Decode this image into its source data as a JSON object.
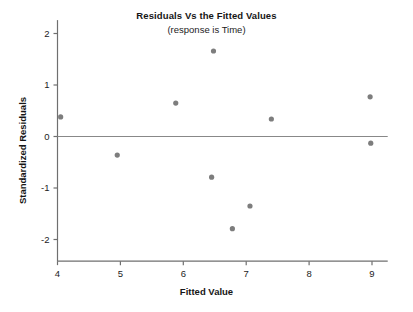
{
  "chart_data": {
    "type": "scatter",
    "title": "Residuals Vs the Fitted Values",
    "subtitle": "(response is Time)",
    "xlabel": "Fitted Value",
    "ylabel": "Standardized Residuals",
    "xlim": [
      3.82,
      9.25
    ],
    "ylim": [
      -2.42,
      2.26
    ],
    "xticks": [
      4,
      5,
      6,
      7,
      8,
      9
    ],
    "xtick_labels": [
      "4",
      "5",
      "6",
      "7",
      "8",
      "9"
    ],
    "yticks": [
      2,
      1,
      0,
      -1,
      -2
    ],
    "ytick_labels": [
      "2",
      "1",
      "0",
      "-1",
      "-2"
    ],
    "grid": false,
    "legend": null,
    "reference_line": {
      "orientation": "horizontal",
      "y": 0,
      "color": "#888888"
    },
    "marker": {
      "shape": "circle",
      "color": "#7d7d7d",
      "size": 4
    },
    "points": [
      {
        "x": 4.05,
        "y": 0.38
      },
      {
        "x": 4.95,
        "y": -0.36
      },
      {
        "x": 5.88,
        "y": 0.65
      },
      {
        "x": 6.48,
        "y": 1.66
      },
      {
        "x": 6.45,
        "y": -0.79
      },
      {
        "x": 6.78,
        "y": -1.79
      },
      {
        "x": 7.06,
        "y": -1.35
      },
      {
        "x": 7.4,
        "y": 0.34
      },
      {
        "x": 8.97,
        "y": 0.77
      },
      {
        "x": 8.98,
        "y": -0.13
      }
    ]
  },
  "colors": {
    "axis": "#6f6f6f",
    "marker": "#7d7d7d",
    "reference_line": "#888888",
    "text": "#161616",
    "background": "#ffffff"
  }
}
